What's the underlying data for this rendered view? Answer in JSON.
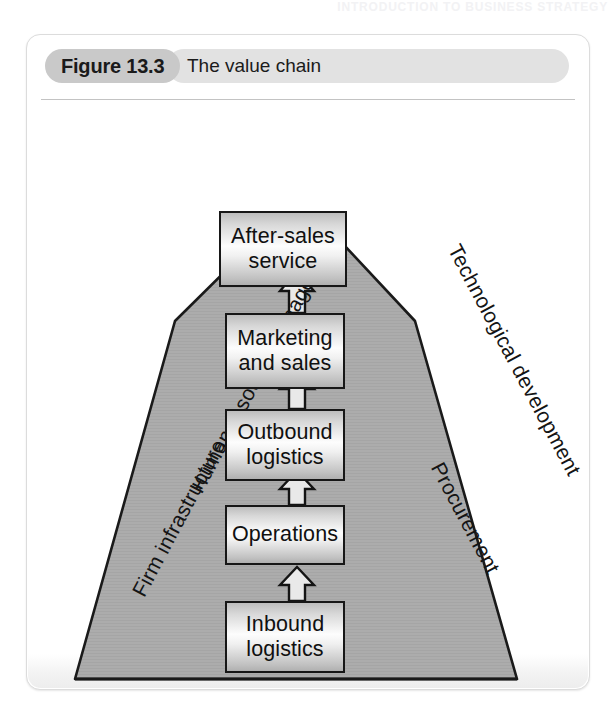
{
  "running_head": "INTRODUCTION TO BUSINESS STRATEGY",
  "figure": {
    "number": "Figure 13.3",
    "title": "The value chain"
  },
  "diagram": {
    "type": "value-chain-triangle",
    "support_activities": [
      {
        "id": "firm-infrastructure",
        "line1": "Firm",
        "line2": "infrastructure",
        "side": "left"
      },
      {
        "id": "human-resource-management",
        "line1": "Human resource",
        "line2": "management",
        "side": "left"
      },
      {
        "id": "technological-development",
        "line1": "Technological",
        "line2": "development",
        "side": "right"
      },
      {
        "id": "procurement",
        "line1": "Procurement",
        "line2": "",
        "side": "right"
      }
    ],
    "primary_activities": [
      {
        "id": "after-sales-service",
        "line1": "After-sales",
        "line2": "service",
        "order": 5
      },
      {
        "id": "marketing-and-sales",
        "line1": "Marketing",
        "line2": "and sales",
        "order": 4
      },
      {
        "id": "outbound-logistics",
        "line1": "Outbound",
        "line2": "logistics",
        "order": 3
      },
      {
        "id": "operations",
        "line1": "Operations",
        "line2": "",
        "order": 2
      },
      {
        "id": "inbound-logistics",
        "line1": "Inbound",
        "line2": "logistics",
        "order": 1
      }
    ],
    "flow_direction": "upward",
    "arrow_count": 4,
    "colors": {
      "triangle_fill": "#acacac",
      "triangle_stroke": "#1a1a1a",
      "box_stroke": "#171717",
      "figure_number_pill": "#c9c9c9",
      "figure_title_pill": "#e2e2e2",
      "card_border": "#dcdcdc",
      "page_background": "#ffffff"
    }
  }
}
